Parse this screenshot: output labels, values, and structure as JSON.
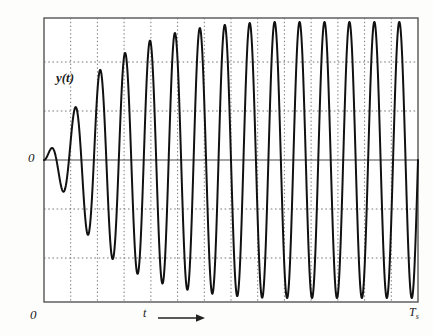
{
  "figure": {
    "background_color": "#fdfdfc",
    "plot_frame_color": "#555555",
    "grid_color": "#777777",
    "curve_color": "#111111"
  },
  "labels": {
    "y_axis_signal": "y(t)",
    "y_axis_zero": "0",
    "origin_zero": "0",
    "x_axis_time": "t",
    "x_axis_end_base": "T",
    "x_axis_end_sub": "s",
    "x_axis_arrow": "right-arrow"
  },
  "chart_data": {
    "type": "line",
    "title": "",
    "xlabel": "t",
    "ylabel": "y(t)",
    "xlim": [
      0,
      1
    ],
    "ylim": [
      -1.08,
      1.08
    ],
    "grid": true,
    "grid_style": "dotted",
    "legend": false,
    "x_tick_labels": [
      "0",
      "T_s"
    ],
    "y_tick_labels": [
      "0"
    ],
    "x_gridline_count": 13,
    "y_gridline_positions": [
      0.75,
      0.375,
      -0.375,
      -0.75
    ],
    "zero_line": 0,
    "series": [
      {
        "name": "y(t)",
        "model": "growing-then-saturating sinusoid",
        "amplitude_envelope": [
          0.0,
          0.3,
          0.62,
          0.75,
          0.85,
          0.91,
          0.95,
          0.975,
          0.99,
          1.0,
          1.0,
          1.0,
          1.0,
          1.0,
          1.0,
          1.0
        ],
        "cycle_count": 15,
        "peaks": [
          0.3,
          0.62,
          0.75,
          0.85,
          0.91,
          0.95,
          0.975,
          0.99,
          1.0,
          1.0,
          1.0,
          1.0,
          1.0,
          1.0,
          1.0
        ],
        "troughs": [
          -0.46,
          -0.69,
          -0.81,
          -0.88,
          -0.93,
          -0.965,
          -0.985,
          -1.0,
          -1.0,
          -1.0,
          -1.0,
          -1.0,
          -1.0,
          -1.0,
          -1.0
        ]
      }
    ]
  }
}
